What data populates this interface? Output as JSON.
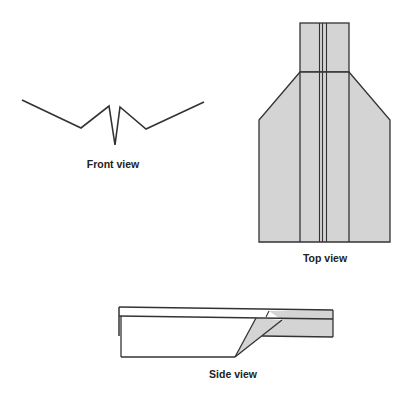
{
  "labels": {
    "front": "Front view",
    "top": "Top view",
    "side": "Side view"
  },
  "colors": {
    "stroke": "#333333",
    "fill_gray": "#d4d4d4",
    "background": "#ffffff"
  }
}
